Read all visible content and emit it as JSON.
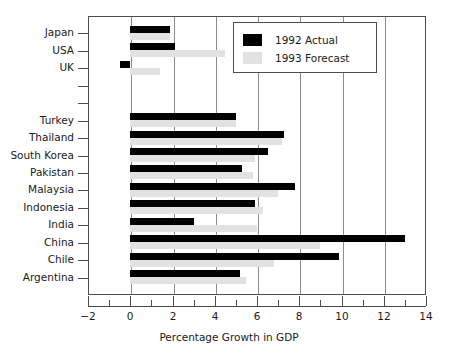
{
  "chart_data": {
    "type": "bar",
    "orientation": "horizontal",
    "title": "",
    "xlabel": "Percentage Growth in GDP",
    "ylabel": "",
    "xlim": [
      -2,
      14
    ],
    "xticks": [
      -2,
      0,
      2,
      4,
      6,
      8,
      10,
      12,
      14
    ],
    "xtick_labels": [
      "−2",
      "0",
      "2",
      "4",
      "6",
      "8",
      "10",
      "12",
      "14"
    ],
    "xminor_ticks": [
      -1,
      1,
      3,
      5,
      7,
      9,
      11,
      13
    ],
    "grid": "vertical-major",
    "legend_position": "upper right",
    "categories": [
      "Japan",
      "USA",
      "UK",
      "",
      "",
      "Turkey",
      "Thailand",
      "South Korea",
      "Pakistan",
      "Malaysia",
      "Indonesia",
      "India",
      "China",
      "Chile",
      "Argentina"
    ],
    "series": [
      {
        "name": "1992 Actual",
        "color": "#000000",
        "values": [
          1.9,
          2.1,
          -0.5,
          null,
          null,
          5.0,
          7.3,
          6.5,
          5.3,
          7.8,
          5.9,
          3.0,
          13.0,
          9.9,
          5.2
        ]
      },
      {
        "name": "1993 Forecast",
        "color": "#e2e2e2",
        "values": [
          1.9,
          4.5,
          1.4,
          null,
          null,
          5.0,
          7.2,
          5.9,
          5.8,
          7.0,
          6.3,
          6.0,
          9.0,
          6.8,
          5.5
        ]
      }
    ]
  },
  "legend": {
    "items": [
      {
        "label": "1992 Actual",
        "color": "#000000"
      },
      {
        "label": "1993 Forecast",
        "color": "#e2e2e2"
      }
    ]
  },
  "axis": {
    "x_title": "Percentage Growth in GDP"
  },
  "colors": {
    "actual": "#000000",
    "forecast": "#e2e2e2",
    "frame": "#4d4d4d",
    "grid": "#8c8c8c",
    "background": "#ffffff",
    "text": "#1a1a1a"
  }
}
